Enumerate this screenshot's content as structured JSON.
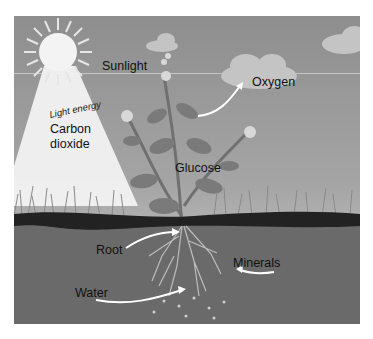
{
  "diagram": {
    "style": "grayscale illustration",
    "labels": {
      "sunlight": "Sunlight",
      "light_energy": "Light energy",
      "carbon_dioxide_line1": "Carbon",
      "carbon_dioxide_line2": "dioxide",
      "oxygen": "Oxygen",
      "glucose": "Glucose",
      "root": "Root",
      "minerals": "Minerals",
      "water": "Water"
    },
    "icons": [
      "sun-icon",
      "cloud-icon",
      "plant-icon",
      "flower-icon",
      "root-icon",
      "arrow-icon"
    ],
    "colors": {
      "sky_top": "#8e8e8e",
      "sky_bottom": "#b3b3b3",
      "light_beam": "#f4f4f4",
      "soil_top": "#222222",
      "soil": "#6a6a6a",
      "text": "#111111",
      "arrow": "#ffffff"
    }
  }
}
